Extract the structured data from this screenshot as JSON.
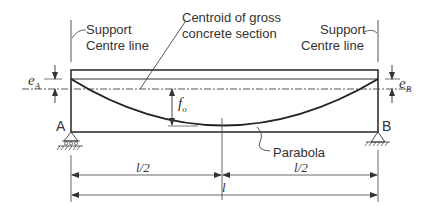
{
  "diagram": {
    "labels": {
      "left_support": [
        "Support",
        "Centre line"
      ],
      "right_support": [
        "Support",
        "Centre line"
      ],
      "centroid": [
        "Centroid of gross",
        "concrete section"
      ],
      "eccentricity_left": "e",
      "eccentricity_left_sub": "A",
      "eccentricity_right": "e",
      "eccentricity_right_sub": "B",
      "sag": "f",
      "sag_sub": "o",
      "support_a": "A",
      "support_b": "B",
      "parabola": "Parabola",
      "half_span_left": "l/2",
      "half_span_right": "l/2",
      "span": "l"
    },
    "colors": {
      "line": "#333333",
      "text": "#333333",
      "background": "#ffffff"
    }
  }
}
